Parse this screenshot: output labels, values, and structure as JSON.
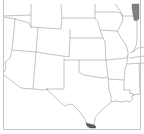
{
  "map": {
    "title": "",
    "region": "South-central United States",
    "colors": {
      "background": "#ffffff",
      "boundary": "#9a9a9a",
      "frame": "#c4c4c4",
      "highlight_lake": "#808080",
      "highlight_south_texas": "#5a5a5a"
    },
    "highlighted_areas": [
      {
        "name": "lake-michigan",
        "color": "#808080"
      },
      {
        "name": "south-texas-tip",
        "color": "#5a5a5a"
      }
    ],
    "states_shown": [
      "Idaho",
      "Montana",
      "Wyoming",
      "South Dakota",
      "Minnesota",
      "Wisconsin",
      "Nevada",
      "Utah",
      "Colorado",
      "Nebraska",
      "Iowa",
      "Illinois",
      "Arizona",
      "New Mexico",
      "Kansas",
      "Missouri",
      "Oklahoma",
      "Arkansas",
      "Texas",
      "Louisiana",
      "Mississippi",
      "Tennessee",
      "Kentucky",
      "Indiana"
    ]
  }
}
